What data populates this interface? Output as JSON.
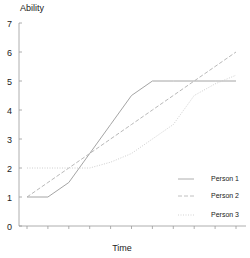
{
  "chart_data": {
    "type": "line",
    "title": "",
    "xlabel": "Time",
    "ylabel": "Ability",
    "ylim": [
      0,
      7
    ],
    "yticks": [
      0,
      1,
      2,
      3,
      4,
      5,
      6,
      7
    ],
    "x": [
      0,
      1,
      2,
      3,
      4,
      5,
      6,
      7,
      8,
      9,
      10
    ],
    "xtick_labels_visible": false,
    "grid": false,
    "legend_position": "lower right",
    "series": [
      {
        "name": "Person 1",
        "style": "solid",
        "color": "#9a9a9a",
        "values": [
          1,
          1,
          1.5,
          2.5,
          3.5,
          4.5,
          5,
          5,
          5,
          5,
          5
        ]
      },
      {
        "name": "Person 2",
        "style": "dashed",
        "color": "#b0b0b0",
        "values": [
          1,
          1.5,
          2,
          2.5,
          3,
          3.5,
          4,
          4.5,
          5,
          5.5,
          6
        ]
      },
      {
        "name": "Person 3",
        "style": "dotted",
        "color": "#c8c8c8",
        "values": [
          2,
          2,
          2,
          2,
          2.2,
          2.5,
          3,
          3.5,
          4.5,
          4.9,
          5.2
        ]
      }
    ]
  },
  "axis": {
    "y_title": "Ability",
    "x_title": "Time",
    "y_labels": [
      "0",
      "1",
      "2",
      "3",
      "4",
      "5",
      "6",
      "7"
    ]
  },
  "legend": {
    "items": [
      {
        "label": "Person 1"
      },
      {
        "label": "Person 2"
      },
      {
        "label": "Person 3"
      }
    ]
  }
}
